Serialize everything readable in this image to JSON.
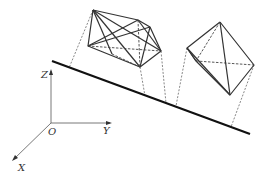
{
  "diagram": {
    "type": "3d-projection-diagram",
    "colors": {
      "line": "#222222",
      "thin": "#444444",
      "label": "#333333",
      "background": "#ffffff"
    },
    "axes": {
      "origin_label": "O",
      "x_label": "X",
      "y_label": "Y",
      "z_label": "Z"
    },
    "plane_line": {
      "from": [
        52,
        61
      ],
      "to": [
        250,
        134
      ]
    },
    "polyhedra": [
      {
        "name": "left-polyhedron",
        "vertices": {
          "A": [
            93,
            10
          ],
          "B": [
            138,
            20
          ],
          "C": [
            150,
            27
          ],
          "D": [
            161,
            51
          ],
          "E": [
            140,
            67
          ],
          "F": [
            88,
            46
          ]
        }
      },
      {
        "name": "right-polyhedron",
        "vertices": {
          "T": [
            220,
            22
          ],
          "L": [
            187,
            48
          ],
          "M": [
            196,
            61
          ],
          "R": [
            254,
            65
          ],
          "B": [
            230,
            95
          ]
        }
      }
    ]
  }
}
